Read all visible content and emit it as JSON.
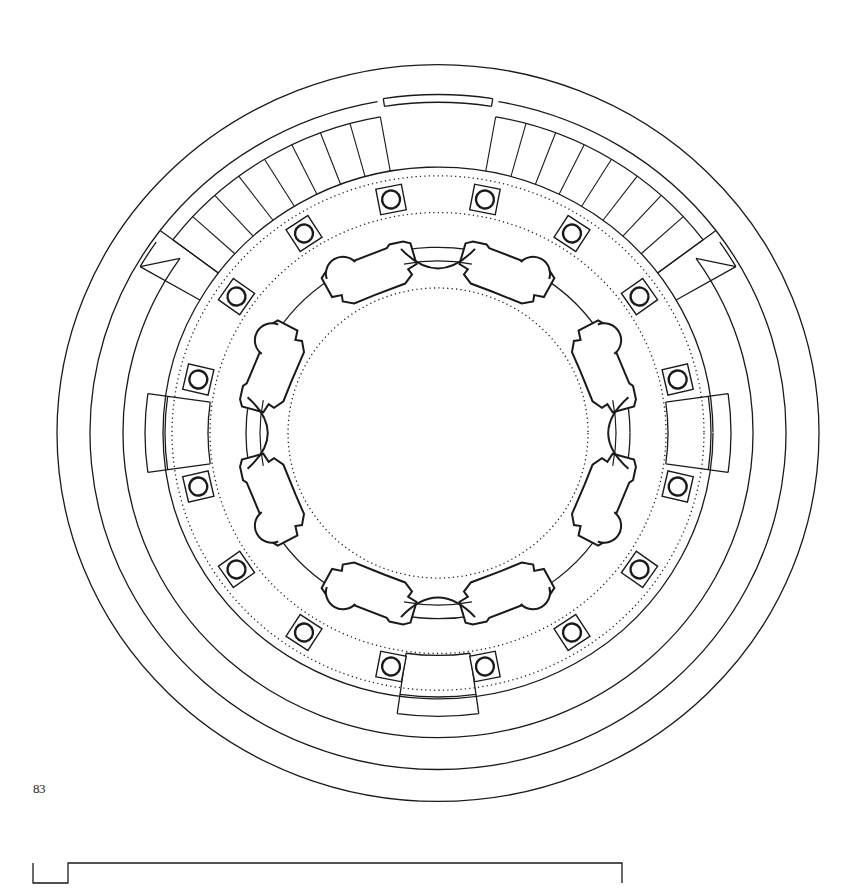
{
  "page": {
    "page_number": "83",
    "background": "#ffffff",
    "ink_color": "#1a1a1a"
  },
  "plan": {
    "title_visible": false,
    "type": "circular-temple-floor-plan",
    "center": {
      "x": 438,
      "y": 433
    },
    "aspect_y": 0.967,
    "rings": {
      "outer_wall_outer": 381,
      "outer_wall_inner": 348,
      "ambulatory_outer": 315,
      "step_band_outer": 340,
      "step_band_inner": 308,
      "stair_outer": 340,
      "colonnade_outer": 275,
      "colonnade_dotted_outer": 266,
      "column_ring": 246,
      "colonnade_dotted_inner": 228,
      "cella_outer": 192,
      "cella_inner": 178,
      "inner_dotted": 150
    },
    "columns": {
      "count": 16,
      "angles_deg": [
        -101,
        -79,
        -57,
        -35,
        -13,
        13,
        35,
        57,
        79,
        101,
        123,
        145,
        167,
        193,
        215,
        237
      ],
      "box_size": 26,
      "circle_radius": 9
    },
    "stairs": [
      {
        "name": "stair-left",
        "from_deg": -143,
        "to_deg": -100,
        "steps": 8
      },
      {
        "name": "stair-right",
        "from_deg": -80,
        "to_deg": -37,
        "steps": 8
      }
    ],
    "niches": [
      {
        "name": "niche-west",
        "angle_deg": 180
      },
      {
        "name": "niche-east",
        "angle_deg": 0
      },
      {
        "name": "niche-south",
        "angle_deg": 90
      }
    ],
    "piers": {
      "count": 8,
      "angles_deg": [
        -112,
        -68,
        -22,
        22,
        68,
        112,
        158,
        202
      ]
    },
    "openings": [
      {
        "name": "opening-north",
        "angle_deg": -90
      },
      {
        "name": "opening-east",
        "angle_deg": 0
      },
      {
        "name": "opening-south",
        "angle_deg": 90
      },
      {
        "name": "opening-west",
        "angle_deg": 180
      }
    ]
  },
  "scale_bar": {
    "x_start": 33,
    "x_step": 68,
    "x_end": 379,
    "y_top": 103,
    "y_bottom": 123,
    "units_visible": false
  }
}
